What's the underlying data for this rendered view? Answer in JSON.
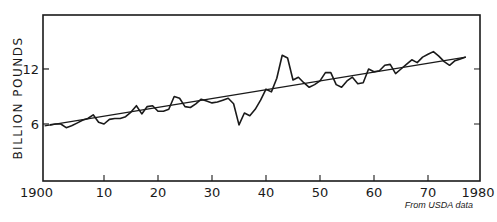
{
  "chart_data": {
    "type": "line",
    "title": "",
    "xlabel": "",
    "ylabel": "BILLION POUNDS",
    "source_note": "From USDA data",
    "xlim": [
      1899,
      1980
    ],
    "ylim": [
      0,
      18.5
    ],
    "x_ticks": [
      1900,
      1910,
      1920,
      1930,
      1940,
      1950,
      1960,
      1970,
      1980
    ],
    "x_tick_labels": [
      "1900",
      "10",
      "20",
      "30",
      "40",
      "50",
      "60",
      "70",
      "1980"
    ],
    "y_ticks": [
      6,
      12
    ],
    "y_tick_labels": [
      "6",
      "12"
    ],
    "grid": false,
    "legend": null,
    "series": [
      {
        "name": "Annual production",
        "x": [
          1900,
          1901,
          1902,
          1903,
          1904,
          1905,
          1906,
          1907,
          1908,
          1909,
          1910,
          1911,
          1912,
          1913,
          1914,
          1915,
          1916,
          1917,
          1918,
          1919,
          1920,
          1921,
          1922,
          1923,
          1924,
          1925,
          1926,
          1927,
          1928,
          1929,
          1930,
          1931,
          1932,
          1933,
          1934,
          1935,
          1936,
          1937,
          1938,
          1939,
          1940,
          1941,
          1942,
          1943,
          1944,
          1945,
          1946,
          1947,
          1948,
          1949,
          1950,
          1951,
          1952,
          1953,
          1954,
          1955,
          1956,
          1957,
          1958,
          1959,
          1960,
          1961,
          1962,
          1963,
          1964,
          1965,
          1966,
          1967,
          1968,
          1969,
          1970,
          1971,
          1972,
          1973,
          1974,
          1975,
          1976,
          1977
        ],
        "values": [
          5.9,
          6.0,
          6.0,
          5.6,
          5.8,
          6.1,
          6.4,
          6.6,
          7.0,
          6.2,
          6.0,
          6.5,
          6.6,
          6.6,
          6.8,
          7.3,
          8.0,
          7.1,
          7.9,
          8.0,
          7.4,
          7.4,
          7.6,
          9.0,
          8.8,
          7.9,
          7.8,
          8.2,
          8.7,
          8.5,
          8.3,
          8.4,
          8.6,
          8.8,
          8.2,
          5.9,
          7.2,
          6.9,
          7.6,
          8.6,
          9.8,
          9.5,
          11.0,
          13.5,
          13.2,
          10.8,
          11.1,
          10.5,
          10.0,
          10.3,
          10.7,
          11.6,
          11.6,
          10.3,
          10.0,
          10.7,
          11.1,
          10.4,
          10.5,
          12.0,
          11.7,
          11.8,
          12.4,
          12.5,
          11.5,
          12.0,
          12.5,
          13.0,
          12.7,
          13.3,
          13.6,
          13.9,
          13.4,
          12.8,
          12.4,
          12.9,
          13.1,
          13.3
        ]
      },
      {
        "name": "Linear trend",
        "x": [
          1899,
          1977
        ],
        "values": [
          5.8,
          13.3
        ]
      }
    ]
  },
  "caption_faint": ""
}
